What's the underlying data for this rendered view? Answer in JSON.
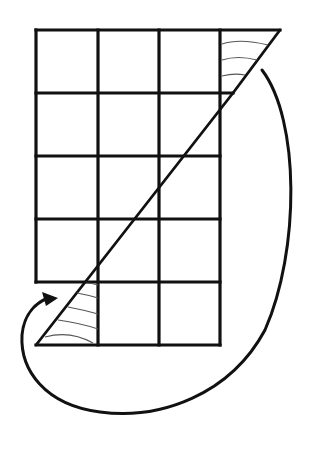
{
  "diagram": {
    "colors": {
      "line": "#111111",
      "hatch": "#555555",
      "background": "#ffffff"
    },
    "grid": {
      "columns": 4,
      "rows": 5,
      "x": [
        36,
        98,
        159,
        220
      ],
      "y": [
        30,
        93,
        156,
        219,
        282,
        345
      ],
      "note": "Only 3 full columns drawn plus top-right triangle; bottom-left triangle inside column 1 of the last row"
    },
    "shapes": {
      "top_triangle": {
        "label": "moved-triangle",
        "points": [
          [
            220,
            30
          ],
          [
            280,
            30
          ],
          [
            233,
            93
          ],
          [
            220,
            93
          ]
        ]
      },
      "bottom_triangle": {
        "label": "cut-triangle",
        "points": [
          [
            36,
            345
          ],
          [
            98,
            345
          ],
          [
            98,
            268
          ]
        ]
      },
      "diagonal": {
        "from": [
          233,
          93
        ],
        "to": [
          36,
          345
        ]
      }
    },
    "arrow": {
      "label": "move-arrow",
      "from": "top-right triangle",
      "to": "bottom-left triangle"
    }
  }
}
